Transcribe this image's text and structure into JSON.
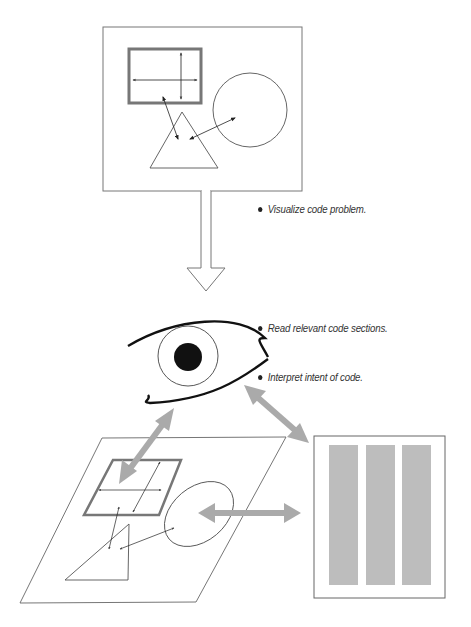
{
  "diagram": {
    "stages": [
      {
        "id": "mental-model",
        "label": "Mental model of code problem (rectangle, circle, triangle with relationships)"
      },
      {
        "id": "eye",
        "label": "Reading eye"
      },
      {
        "id": "projected-model",
        "label": "Mental model mapped to code"
      },
      {
        "id": "code-listing",
        "label": "Code page with three columns"
      }
    ],
    "captions": {
      "visualize": "Visualize code problem.",
      "read": "Read relevant code sections.",
      "interpret": "Interpret intent of code."
    },
    "colors": {
      "line": "#555555",
      "thick_outline": "#777777",
      "gray_arrow": "#aaaaaa",
      "code_bar": "#bdbdbd",
      "ink": "#111111"
    },
    "code_columns": 3
  }
}
